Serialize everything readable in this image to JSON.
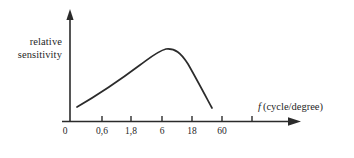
{
  "figure": {
    "background_color": "#ffffff",
    "ink_color": "#2b2b2b"
  },
  "axes": {
    "y_label_line1": "relative",
    "y_label_line2": "sensitivity",
    "x_title_symbol": "f",
    "x_title_unit": "(cycle/degree)",
    "origin_label": "0"
  },
  "chart_data": {
    "type": "line",
    "title": "",
    "subtitle": "",
    "xlabel": "f (cycle/degree)",
    "ylabel": "relative sensitivity",
    "grid": false,
    "legend": null,
    "x_scale": "logarithmic",
    "x_tick_labels": [
      "0",
      "0,6",
      "1,8",
      "6",
      "18",
      "60"
    ],
    "x_tick_pixels": [
      65,
      102,
      131,
      162,
      192,
      222
    ],
    "unlabeled_tick_pixels": [
      252
    ],
    "y_tick_labels": [],
    "annotations": [],
    "series": [
      {
        "name": "contrast sensitivity function",
        "x": [
          "0,3",
          "0,6",
          "1,2",
          "1,8",
          "3",
          "4,5",
          "6",
          "8",
          "12",
          "18",
          "30",
          "45"
        ],
        "values": [
          14,
          26,
          42,
          52,
          66,
          76,
          86,
          88,
          80,
          62,
          34,
          12
        ],
        "ylim": [
          0,
          100
        ]
      }
    ]
  },
  "curve_geometry": {
    "start_point": [
      77,
      107
    ],
    "peak_point": [
      166,
      49
    ],
    "end_point": [
      212,
      108
    ],
    "path": "M 77 107 C 96 96, 120 80, 140 65 C 151 57, 158 51, 166 49 C 175 48, 181 53, 188 64 C 196 78, 205 95, 212 108"
  }
}
